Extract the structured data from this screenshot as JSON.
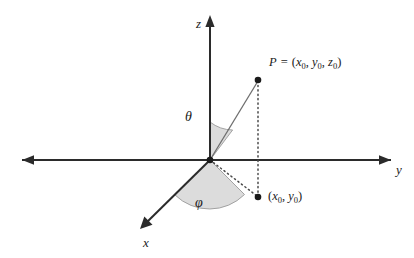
{
  "figure": {
    "type": "diagram",
    "background": "#ffffff",
    "line_color": "#2b2b2b",
    "wedge_fill": "#dcdcdc",
    "wedge_stroke": "#8a8a8a",
    "axes": {
      "z": {
        "label": "z",
        "direction": "up"
      },
      "y": {
        "label": "y",
        "direction": "right"
      },
      "x": {
        "label": "x",
        "direction": "down-left"
      }
    },
    "angles": {
      "theta": {
        "label": "θ",
        "between": "z-axis and ray OP"
      },
      "phi": {
        "label": "φ",
        "between": "x-axis and projection ray"
      }
    },
    "points": {
      "origin": {
        "label": ""
      },
      "p": {
        "name": "P",
        "equals": "=",
        "open": "(",
        "x": "x",
        "xsub": "0",
        "comma1": ",",
        "y": "y",
        "ysub": "0",
        "comma2": ",",
        "z": "z",
        "zsub": "0",
        "close": ")"
      },
      "projection": {
        "open": "(",
        "x": "x",
        "xsub": "0",
        "comma1": ",",
        "y": "y",
        "ysub": "0",
        "close": ")"
      }
    }
  }
}
